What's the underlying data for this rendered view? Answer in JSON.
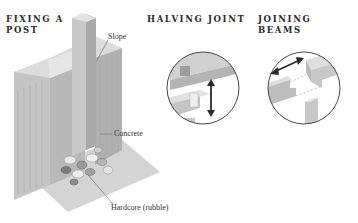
{
  "diagrams": [
    {
      "heading": "FIXING A POST",
      "heading_lines": [
        "FIXING A",
        "POST"
      ],
      "labels": {
        "slope": "Slope",
        "concrete": "Concrete",
        "hardcore": "Hardcore (rubble)"
      }
    },
    {
      "heading": "HALVING JOINT"
    },
    {
      "heading": "JOINING BEAMS"
    }
  ],
  "colors": {
    "block_light": "#d9d9d9",
    "block_mid": "#bdbdbd",
    "block_dark": "#a8a8a8",
    "ground": "#cfcfcf",
    "arrow": "#2a2a2a",
    "circle_stroke": "#333333"
  }
}
